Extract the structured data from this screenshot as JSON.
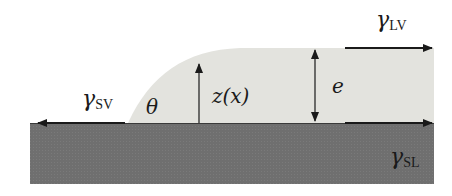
{
  "diagram": {
    "colors": {
      "background": "#ffffff",
      "substrate": "#6f6f6f",
      "liquid": "#e3e3de",
      "arrow": "#1a1a1a"
    },
    "labels": {
      "gamma_sv": {
        "symbol": "γ",
        "subscript": "SV"
      },
      "gamma_lv": {
        "symbol": "γ",
        "subscript": "LV"
      },
      "gamma_sl": {
        "symbol": "γ",
        "subscript": "SL"
      },
      "theta": "θ",
      "z_of_x": "z(x)",
      "thickness": "e"
    },
    "components": [
      "solid-substrate",
      "liquid-film",
      "solid-vapor-tension-arrow",
      "liquid-vapor-tension-arrow",
      "solid-liquid-tension-arrow",
      "height-profile-arrow",
      "film-thickness-double-arrow"
    ]
  }
}
